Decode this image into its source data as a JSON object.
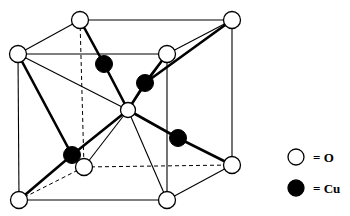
{
  "figure": {
    "background_color": "#ffffff",
    "line_color": "#000000",
    "atom_fill_oxygen": "#ffffff",
    "atom_fill_copper": "#000000"
  },
  "structure": {
    "cell_type": "cubic-unit-cell",
    "oxygen_atoms": [
      {
        "id": "O-top-back-left",
        "x": 18,
        "y": 54,
        "r": 8.5,
        "hidden": false
      },
      {
        "id": "O-top-back-mid",
        "x": 80,
        "y": 20,
        "r": 8.5,
        "hidden": false
      },
      {
        "id": "O-top-back-right",
        "x": 232,
        "y": 20,
        "r": 8.5,
        "hidden": false
      },
      {
        "id": "O-top-front-right",
        "x": 167,
        "y": 54,
        "r": 8.5,
        "hidden": false
      },
      {
        "id": "O-bottom-back-mid",
        "x": 84,
        "y": 167,
        "r": 8.5,
        "hidden": true
      },
      {
        "id": "O-bottom-back-right",
        "x": 232,
        "y": 165,
        "r": 8.5,
        "hidden": false
      },
      {
        "id": "O-bottom-front-left",
        "x": 19,
        "y": 200,
        "r": 8.5,
        "hidden": false
      },
      {
        "id": "O-bottom-front-right",
        "x": 167,
        "y": 200,
        "r": 8.5,
        "hidden": false
      },
      {
        "id": "O-body-center",
        "x": 128,
        "y": 110,
        "r": 7.5,
        "hidden": false
      }
    ],
    "copper_atoms": [
      {
        "id": "Cu-upper-left",
        "x": 104,
        "y": 64,
        "r": 8.5
      },
      {
        "id": "Cu-upper-right",
        "x": 145,
        "y": 83,
        "r": 8.5
      },
      {
        "id": "Cu-mid-right",
        "x": 178,
        "y": 138,
        "r": 8.5
      },
      {
        "id": "Cu-lower-left",
        "x": 72,
        "y": 155,
        "r": 8.5
      }
    ],
    "cell_edges_solid": [
      [
        18,
        54,
        80,
        20
      ],
      [
        80,
        20,
        232,
        20
      ],
      [
        18,
        54,
        167,
        54
      ],
      [
        167,
        54,
        232,
        20
      ],
      [
        18,
        54,
        19,
        200
      ],
      [
        232,
        20,
        232,
        165
      ],
      [
        167,
        54,
        167,
        200
      ],
      [
        19,
        200,
        167,
        200
      ],
      [
        167,
        200,
        232,
        165
      ]
    ],
    "cell_edges_dashed": [
      [
        80,
        20,
        84,
        167
      ],
      [
        84,
        167,
        19,
        200
      ],
      [
        84,
        167,
        232,
        165
      ]
    ],
    "bonds_oxygen_to_copper": [
      [
        128,
        110,
        104,
        64
      ],
      [
        128,
        110,
        145,
        83
      ],
      [
        128,
        110,
        178,
        138
      ],
      [
        128,
        110,
        72,
        155
      ]
    ],
    "bonds_copper_to_oxygen": [
      [
        104,
        64,
        80,
        20
      ],
      [
        145,
        83,
        167,
        54
      ],
      [
        145,
        83,
        232,
        20
      ],
      [
        178,
        138,
        232,
        165
      ],
      [
        72,
        155,
        18,
        54
      ],
      [
        72,
        155,
        19,
        200
      ]
    ],
    "bonds_thin_center": [
      [
        128,
        110,
        18,
        54
      ],
      [
        128,
        110,
        84,
        167
      ],
      [
        128,
        110,
        167,
        200
      ],
      [
        128,
        110,
        167,
        54
      ]
    ]
  },
  "legend": {
    "items": [
      {
        "key": "oxygen",
        "marker": "open-circle",
        "marker_fill": "#ffffff",
        "marker_x": 296,
        "marker_y": 157,
        "marker_r": 8,
        "label": "= O",
        "label_x": 313,
        "label_y": 162
      },
      {
        "key": "copper",
        "marker": "filled-circle",
        "marker_fill": "#000000",
        "marker_x": 296,
        "marker_y": 188,
        "marker_r": 8,
        "label": "= Cu",
        "label_x": 313,
        "label_y": 193
      }
    ]
  }
}
